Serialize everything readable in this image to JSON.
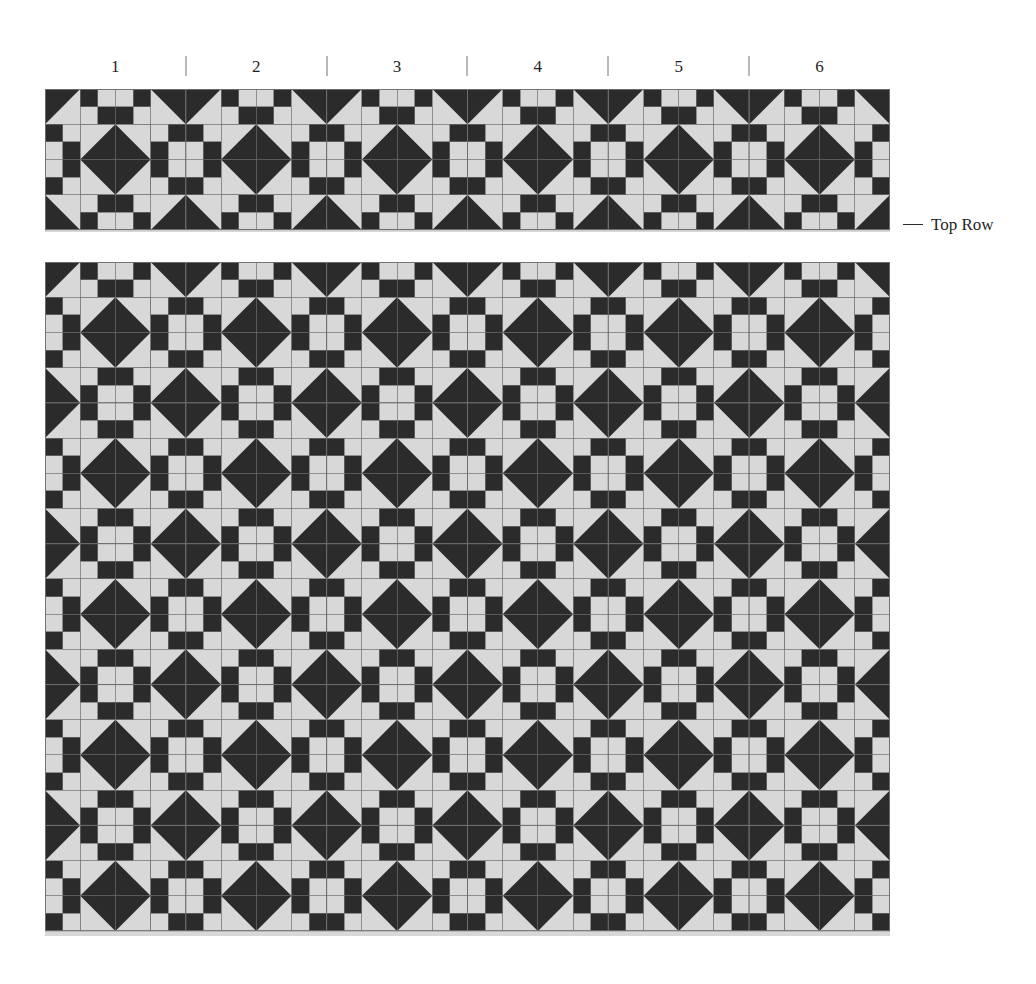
{
  "diagram": {
    "colors": {
      "dark": "#2b2b2b",
      "light": "#d8d8d8",
      "seam_line": "#6e6e6e",
      "background": "#ffffff",
      "tick": "#b9b9b9",
      "text": "#1f1f1f"
    }
  },
  "column_ruler": {
    "name": "block-column-numbers",
    "labels": [
      "1",
      "2",
      "3",
      "4",
      "5",
      "6"
    ],
    "tick_separator": "|"
  },
  "top_row": {
    "label": "Top Row",
    "leader": "—",
    "columns": 6,
    "rows": 1
  },
  "main_body": {
    "columns": 6,
    "rows": 4.75
  },
  "block": {
    "name": "sawtooth-nine-patch-block",
    "units_across": 4,
    "units_down": 4,
    "unit_map": [
      [
        "hst-tl",
        "fourpatch-a",
        "fourpatch-b",
        "hst-tr"
      ],
      [
        "fourpatch-c",
        "center-dark",
        "center-dark",
        "fourpatch-d"
      ],
      [
        "fourpatch-e",
        "center-dark",
        "center-dark",
        "fourpatch-f"
      ],
      [
        "hst-bl",
        "fourpatch-g",
        "fourpatch-h",
        "hst-br"
      ]
    ]
  },
  "chart_data": {
    "type": "heatmap",
    "xlabel": "",
    "ylabel": "",
    "categories": [
      "1",
      "2",
      "3",
      "4",
      "5",
      "6"
    ],
    "legend": [
      "Top Row"
    ],
    "grid": true,
    "series": [
      {
        "name": "Top Row",
        "values": [
          1,
          1,
          1,
          1,
          1,
          1
        ]
      },
      {
        "name": "Body Rows",
        "values": [
          4.75,
          4.75,
          4.75,
          4.75,
          4.75,
          4.75
        ]
      }
    ]
  }
}
